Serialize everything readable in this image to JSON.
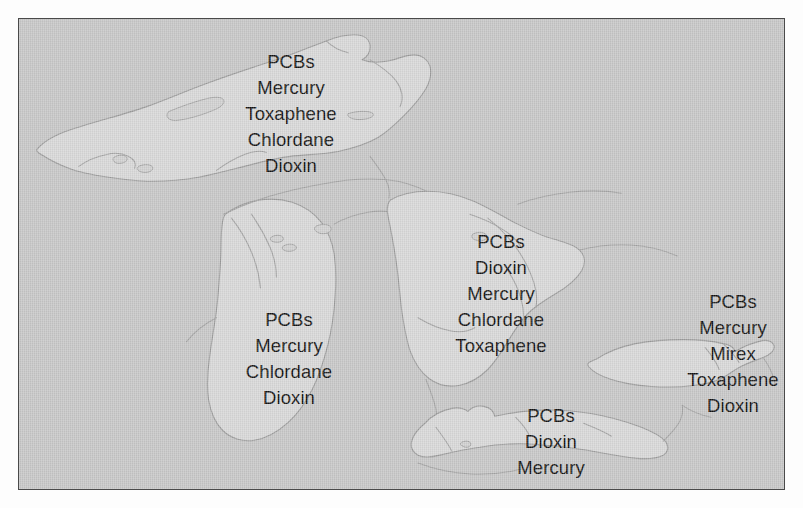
{
  "figure": {
    "type": "great-lakes-contaminant-map",
    "background_color": "#c6c6c6",
    "lake_fill_color": "#d7d7d7",
    "outline_color": "#9a9a9a",
    "border_color": "#4a4a4a",
    "text_color": "#111111"
  },
  "lakes": [
    {
      "id": "superior",
      "name": "Lake Superior",
      "contaminants": [
        "PCBs",
        "Mercury",
        "Toxaphene",
        "Chlordane",
        "Dioxin"
      ]
    },
    {
      "id": "michigan",
      "name": "Lake Michigan",
      "contaminants": [
        "PCBs",
        "Mercury",
        "Chlordane",
        "Dioxin"
      ]
    },
    {
      "id": "huron",
      "name": "Lake Huron",
      "contaminants": [
        "PCBs",
        "Dioxin",
        "Mercury",
        "Chlordane",
        "Toxaphene"
      ]
    },
    {
      "id": "ontario",
      "name": "Lake Ontario",
      "contaminants": [
        "PCBs",
        "Mercury",
        "Mirex",
        "Toxaphene",
        "Dioxin"
      ]
    },
    {
      "id": "erie",
      "name": "Lake Erie",
      "contaminants": [
        "PCBs",
        "Dioxin",
        "Mercury"
      ]
    }
  ]
}
